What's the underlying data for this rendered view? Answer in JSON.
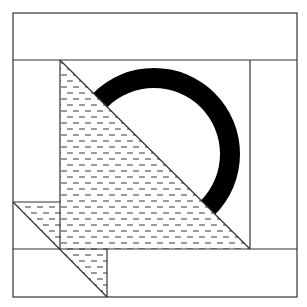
{
  "figure": {
    "colors": {
      "background": "#ffffff",
      "line": "#333333",
      "ring": "#000000",
      "hatch": "#555555"
    },
    "outer_square": {
      "x": 13,
      "y": 13,
      "w": 284,
      "h": 284
    },
    "lines": [
      {
        "name": "top-band-line",
        "x1": 13,
        "y1": 60,
        "x2": 297,
        "y2": 60
      },
      {
        "name": "bottom-band-line",
        "x1": 60,
        "y1": 249,
        "x2": 297,
        "y2": 249
      },
      {
        "name": "left-lower-band-line",
        "x1": 13,
        "y1": 249,
        "x2": 60,
        "y2": 249
      },
      {
        "name": "left-inner-vertical",
        "x1": 60,
        "y1": 60,
        "x2": 60,
        "y2": 249
      },
      {
        "name": "right-inner-vertical",
        "x1": 250,
        "y1": 60,
        "x2": 250,
        "y2": 249
      },
      {
        "name": "left-small-horizontal",
        "x1": 13,
        "y1": 202,
        "x2": 60,
        "y2": 202
      },
      {
        "name": "bottom-small-vertical",
        "x1": 107,
        "y1": 249,
        "x2": 107,
        "y2": 297
      },
      {
        "name": "main-diagonal",
        "x1": 60,
        "y1": 60,
        "x2": 250,
        "y2": 249
      },
      {
        "name": "small-diagonal",
        "x1": 13,
        "y1": 202,
        "x2": 107,
        "y2": 297
      }
    ],
    "ring": {
      "cx": 154,
      "cy": 154,
      "outer_r": 86,
      "inner_r": 66,
      "visible_side": "upper-right of diagonal"
    },
    "hatched_regions": [
      {
        "name": "large-triangle",
        "points": "60,60 250,249 60,249"
      },
      {
        "name": "small-triangle-left",
        "points": "13,202 60,202 60,249"
      },
      {
        "name": "small-triangle-bottom",
        "points": "60,249 107,249 107,297"
      }
    ]
  }
}
